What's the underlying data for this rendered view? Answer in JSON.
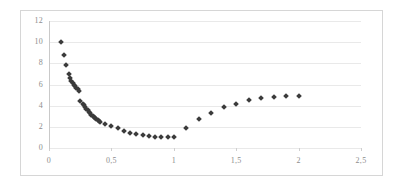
{
  "chart_data": {
    "type": "scatter",
    "title": "",
    "subtitle": "",
    "xlabel": "",
    "ylabel": "",
    "xlim": [
      0,
      2.5
    ],
    "ylim": [
      0,
      12
    ],
    "grid": true,
    "grid_axis": "y",
    "legend": false,
    "legend_position": "none",
    "marker": "diamond",
    "marker_color": "#3b3b3b",
    "background_color": "#ffffff",
    "gridline_color": "#e9e9e9",
    "axis_line_color": "#c9c9c9",
    "tick_label_color": "#8d8d8d",
    "decimal_separator": ",",
    "xticks": [
      0,
      0.5,
      1,
      1.5,
      2,
      2.5
    ],
    "xtick_labels": [
      "0",
      "0,5",
      "1",
      "1,5",
      "2",
      "2,5"
    ],
    "yticks": [
      0,
      2,
      4,
      6,
      8,
      10,
      12
    ],
    "ytick_labels": [
      "0",
      "2",
      "4",
      "6",
      "8",
      "10",
      "12"
    ],
    "series": [
      {
        "name": "series-1",
        "x": [
          0.1,
          0.12,
          0.14,
          0.16,
          0.17,
          0.18,
          0.19,
          0.2,
          0.21,
          0.22,
          0.23,
          0.24,
          0.25,
          0.27,
          0.28,
          0.29,
          0.3,
          0.31,
          0.32,
          0.33,
          0.34,
          0.35,
          0.36,
          0.37,
          0.38,
          0.39,
          0.4,
          0.41,
          0.45,
          0.5,
          0.55,
          0.6,
          0.65,
          0.7,
          0.75,
          0.8,
          0.85,
          0.9,
          0.95,
          1.0,
          1.1,
          1.2,
          1.3,
          1.4,
          1.5,
          1.6,
          1.7,
          1.8,
          1.9,
          2.0
        ],
        "y": [
          10.0,
          8.8,
          7.8,
          7.0,
          6.6,
          6.3,
          6.1,
          6.0,
          5.85,
          5.7,
          5.55,
          5.4,
          4.45,
          4.2,
          4.05,
          3.9,
          3.7,
          3.55,
          3.4,
          3.3,
          3.15,
          3.05,
          2.95,
          2.85,
          2.75,
          2.65,
          2.55,
          2.5,
          2.3,
          2.1,
          1.85,
          1.6,
          1.45,
          1.3,
          1.2,
          1.1,
          1.05,
          1.0,
          1.0,
          1.0,
          1.9,
          2.7,
          3.3,
          3.85,
          4.2,
          4.5,
          4.7,
          4.85,
          4.9,
          4.9
        ]
      }
    ]
  },
  "figure": {
    "caption": ""
  }
}
